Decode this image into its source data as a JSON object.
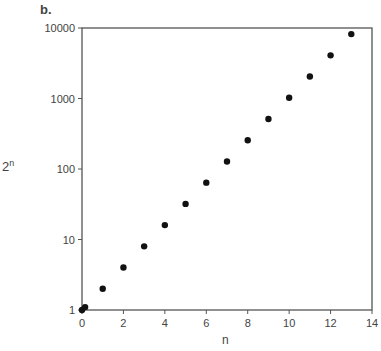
{
  "panel_label": "b.",
  "chart_data": {
    "type": "scatter",
    "title": "",
    "xlabel": "n",
    "ylabel": "2^n",
    "ylabel_base": "2",
    "ylabel_exp": "n",
    "yscale": "log",
    "xlim": [
      0,
      14
    ],
    "ylim": [
      1,
      10000
    ],
    "x_ticks": [
      0,
      2,
      4,
      6,
      8,
      10,
      12,
      14
    ],
    "y_ticks": [
      1,
      10,
      100,
      1000,
      10000
    ],
    "grid": false,
    "legend": null,
    "points": [
      {
        "x": 0,
        "y": 1
      },
      {
        "x": 0.15,
        "y": 1.1
      },
      {
        "x": 1,
        "y": 2
      },
      {
        "x": 2,
        "y": 4
      },
      {
        "x": 3,
        "y": 8
      },
      {
        "x": 4,
        "y": 16
      },
      {
        "x": 5,
        "y": 32
      },
      {
        "x": 6,
        "y": 64
      },
      {
        "x": 7,
        "y": 128
      },
      {
        "x": 8,
        "y": 256
      },
      {
        "x": 9,
        "y": 512
      },
      {
        "x": 10,
        "y": 1024
      },
      {
        "x": 11,
        "y": 2048
      },
      {
        "x": 12,
        "y": 4096
      },
      {
        "x": 13,
        "y": 8192
      }
    ]
  }
}
